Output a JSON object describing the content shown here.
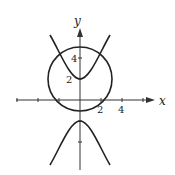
{
  "figure": {
    "x_axis_label": "x",
    "y_axis_label": "y",
    "x_tick_labels": [
      "2",
      "4"
    ],
    "y_tick_labels": [
      "2",
      "4"
    ],
    "curves": [
      {
        "name": "circle",
        "equation": "x^2 + (y-2)^2 = 9",
        "center": [
          0,
          2
        ],
        "radius": 3
      },
      {
        "name": "hyperbola",
        "equation": "y^2/4 - x^2 = 1",
        "vertices": [
          [
            0,
            2
          ],
          [
            0,
            -2
          ]
        ]
      }
    ],
    "colors": {
      "stroke": "#222222",
      "background": "#ffffff"
    }
  }
}
